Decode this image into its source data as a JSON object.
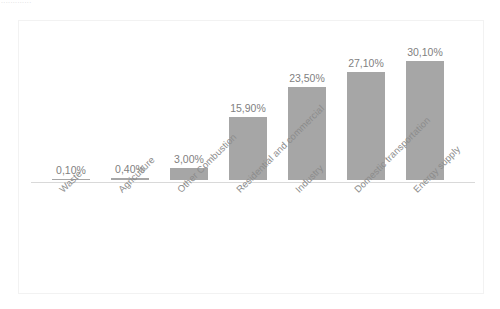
{
  "header": {
    "fragment_text": "............."
  },
  "colors": {
    "bar": "#a6a6a6",
    "axis": "#d9d9d9",
    "frame": "#f2f2f2",
    "label_text": "#8c8c8c",
    "value_text": "#7f7f7f",
    "background": "#ffffff"
  },
  "chart_data": {
    "type": "bar",
    "title": "",
    "subtitle": "",
    "xlabel": "",
    "ylabel": "",
    "ylim": [
      0,
      33
    ],
    "grid": false,
    "legend": false,
    "axis_visible": {
      "x_axis_line": true,
      "y_axis_line": false,
      "y_tick_labels": false
    },
    "value_format": "comma-decimal-percent",
    "categories": [
      "Waste",
      "Agriculture",
      "Other Combustion",
      "Residential and commercial",
      "Industry",
      "Domestic transportation",
      "Energy supply"
    ],
    "values": [
      0.1,
      0.4,
      3.0,
      15.9,
      23.5,
      27.1,
      30.1
    ],
    "value_labels": [
      "0,10%",
      "0,40%",
      "3,00%",
      "15,90%",
      "23,50%",
      "27,10%",
      "30,10%"
    ],
    "category_label_rotation_deg": -45
  }
}
